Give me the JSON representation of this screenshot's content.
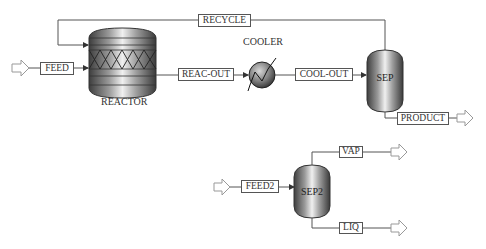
{
  "diagram": {
    "type": "process-flowsheet",
    "units": {
      "reactor": {
        "label": "REACTOR"
      },
      "cooler": {
        "label": "COOLER"
      },
      "sep": {
        "label": "SEP"
      },
      "sep2": {
        "label": "SEP2"
      }
    },
    "streams": {
      "feed": "FEED",
      "recycle": "RECYCLE",
      "reac_out": "REAC-OUT",
      "cool_out": "COOL-OUT",
      "product": "PRODUCT",
      "feed2": "FEED2",
      "vap": "VAP",
      "liq": "LIQ"
    },
    "colors": {
      "line": "#555555",
      "vessel_dark": "#4a4a4a",
      "vessel_light": "#e8e8e8",
      "arrow_fill": "#ffffff",
      "arrow_stroke": "#888888"
    }
  }
}
